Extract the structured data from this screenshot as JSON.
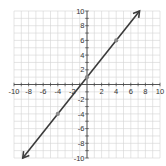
{
  "header": {
    "partial_text": "...y="
  },
  "chart_data": {
    "type": "line",
    "title": "",
    "xlabel": "",
    "ylabel": "",
    "xlim": [
      -10,
      10
    ],
    "ylim": [
      -10,
      10
    ],
    "grid": true,
    "x_ticks": [
      -10,
      -8,
      -6,
      -4,
      -2,
      2,
      4,
      6,
      8,
      10
    ],
    "y_ticks": [
      10,
      8,
      6,
      4,
      2,
      -2,
      -4,
      -6,
      -8,
      -10
    ],
    "x_tick_labels": [
      "-10",
      "-8",
      "-6",
      "-4",
      "-2",
      "2",
      "4",
      "6",
      "8",
      "10"
    ],
    "y_tick_labels": [
      "10",
      "8",
      "6",
      "4",
      "2",
      "-2",
      "-4",
      "-6",
      "-8",
      "-10"
    ],
    "series": [
      {
        "name": "line",
        "equation": "y = (5/4)x + 1",
        "slope": 1.25,
        "intercept": 1,
        "arrows": "both",
        "x_range": [
          -8.8,
          7.2
        ],
        "color": "#3a3a3a"
      }
    ],
    "points": [
      {
        "x": -4,
        "y": -4
      },
      {
        "x": 0,
        "y": 1
      },
      {
        "x": 4,
        "y": 6
      }
    ],
    "point_color": "#8a8a8a"
  }
}
